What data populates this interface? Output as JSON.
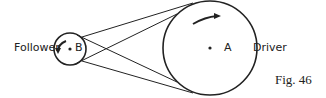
{
  "labels": {
    "follower": "Follower",
    "b": "B",
    "a": "A",
    "driver": "Driver",
    "caption": "Fig. 46"
  },
  "colors": {
    "stroke": "#222222",
    "background": "#ffffff"
  }
}
